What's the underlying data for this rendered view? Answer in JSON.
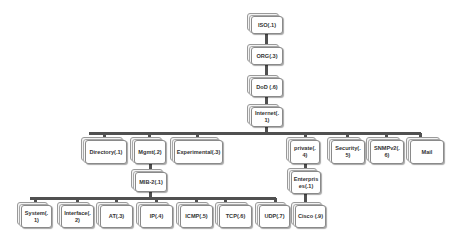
{
  "diagram": {
    "line_color": "#505050",
    "box_border_color": "#8a8a8a",
    "text_color": "#333333",
    "nodes": {
      "iso": {
        "label": "ISO(.1)"
      },
      "org": {
        "label": "ORG(.3)"
      },
      "dod": {
        "label": "DoD (.6)"
      },
      "internet": {
        "label": "Internet(.1)"
      },
      "directory": {
        "label": "Directory(.1)"
      },
      "mgmt": {
        "label": "Mgmt(.2)"
      },
      "experimental": {
        "label": "Experimental(.3)"
      },
      "private": {
        "label": "private(.4)"
      },
      "security": {
        "label": "Security(.5)"
      },
      "snmpv2": {
        "label": "SNMPv2(.6)"
      },
      "mail": {
        "label": "Mail"
      },
      "mib2": {
        "label": "MIB-2(.1)"
      },
      "enterprises": {
        "label": "Enterprises(.1)"
      },
      "system": {
        "label": "System(.1)"
      },
      "interface": {
        "label": "Interface(.2)"
      },
      "at": {
        "label": "AT(.3)"
      },
      "ip": {
        "label": "IP(.4)"
      },
      "icmp": {
        "label": "ICMP(.5)"
      },
      "tcp": {
        "label": "TCP(.6)"
      },
      "udp": {
        "label": "UDP(.7)"
      },
      "cisco": {
        "label": "Cisco (.9)"
      }
    },
    "edges": [
      [
        "iso",
        "org"
      ],
      [
        "org",
        "dod"
      ],
      [
        "dod",
        "internet"
      ],
      [
        "internet",
        "directory"
      ],
      [
        "internet",
        "mgmt"
      ],
      [
        "internet",
        "experimental"
      ],
      [
        "internet",
        "private"
      ],
      [
        "internet",
        "security"
      ],
      [
        "internet",
        "snmpv2"
      ],
      [
        "internet",
        "mail"
      ],
      [
        "mgmt",
        "mib2"
      ],
      [
        "private",
        "enterprises"
      ],
      [
        "enterprises",
        "cisco"
      ],
      [
        "mib2",
        "system"
      ],
      [
        "mib2",
        "interface"
      ],
      [
        "mib2",
        "at"
      ],
      [
        "mib2",
        "ip"
      ],
      [
        "mib2",
        "icmp"
      ],
      [
        "mib2",
        "tcp"
      ],
      [
        "mib2",
        "udp"
      ]
    ]
  }
}
